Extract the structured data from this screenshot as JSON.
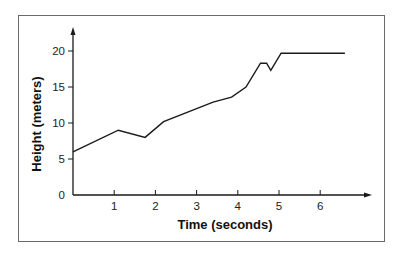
{
  "chart_data": {
    "type": "line",
    "title": "",
    "xlabel": "Time (seconds)",
    "ylabel": "Height (meters)",
    "xlim": [
      0,
      7
    ],
    "ylim": [
      0,
      22
    ],
    "x_ticks": [
      1,
      2,
      3,
      4,
      5,
      6
    ],
    "y_ticks": [
      0,
      5,
      10,
      15,
      20
    ],
    "grid": false,
    "legend": null,
    "series": [
      {
        "name": "Height",
        "color": "#1a1a1a",
        "points": [
          [
            0,
            6.0
          ],
          [
            1.1,
            9.0
          ],
          [
            1.75,
            8.0
          ],
          [
            2.2,
            10.2
          ],
          [
            3.0,
            12.0
          ],
          [
            3.4,
            12.9
          ],
          [
            3.85,
            13.6
          ],
          [
            4.2,
            15.0
          ],
          [
            4.55,
            18.3
          ],
          [
            4.7,
            18.3
          ],
          [
            4.8,
            17.3
          ],
          [
            5.05,
            19.7
          ],
          [
            6.6,
            19.7
          ]
        ]
      }
    ]
  },
  "labels": {
    "x_axis_title": "Time (seconds)",
    "y_axis_title": "Height (meters)",
    "x_tick_labels": [
      "1",
      "2",
      "3",
      "4",
      "5",
      "6"
    ],
    "y_tick_labels": [
      "0",
      "5",
      "10",
      "15",
      "20"
    ]
  },
  "colors": {
    "line": "#1a1a1a",
    "axis": "#1a1a1a",
    "frame": "#6a6a6a",
    "background": "#ffffff"
  }
}
